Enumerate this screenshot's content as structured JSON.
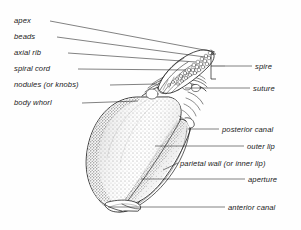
{
  "figure": {
    "background_color": "#fefefe",
    "ink_color": "#1a1a1a"
  },
  "labels_left": [
    {
      "id": "apex",
      "text": "apex",
      "x": 14,
      "y": 16,
      "line_x1": 50,
      "line_y1": 21,
      "line_x2": 215,
      "line_y2": 52
    },
    {
      "id": "beads",
      "text": "beads",
      "x": 14,
      "y": 32,
      "line_x1": 57,
      "line_y1": 37,
      "line_x2": 205,
      "line_y2": 57
    },
    {
      "id": "axial-rib",
      "text": "axial rib",
      "x": 14,
      "y": 48,
      "line_x1": 68,
      "line_y1": 53,
      "line_x2": 196,
      "line_y2": 62
    },
    {
      "id": "spiral-cord",
      "text": "spiral cord",
      "x": 14,
      "y": 64,
      "line_x1": 78,
      "line_y1": 69,
      "line_x2": 186,
      "line_y2": 70
    },
    {
      "id": "nodules",
      "text": "nodules (or knobs)",
      "x": 14,
      "y": 80,
      "line_x1": 110,
      "line_y1": 85,
      "line_x2": 157,
      "line_y2": 84
    },
    {
      "id": "body-whorl",
      "text": "body whorl",
      "x": 14,
      "y": 98,
      "line_x1": 82,
      "line_y1": 103,
      "line_x2": 138,
      "line_y2": 101
    }
  ],
  "labels_right": [
    {
      "id": "spire",
      "text": "spire",
      "x": 255,
      "y": 62,
      "line_x1": 225,
      "line_y1": 66,
      "line_x2": 252,
      "line_y2": 66
    },
    {
      "id": "suture",
      "text": "suture",
      "x": 253,
      "y": 84,
      "line_x1": 185,
      "line_y1": 88,
      "line_x2": 250,
      "line_y2": 88
    },
    {
      "id": "posterior-canal",
      "text": "posterior canal",
      "x": 222,
      "y": 125,
      "line_x1": 188,
      "line_y1": 129,
      "line_x2": 219,
      "line_y2": 129
    },
    {
      "id": "outer-lip",
      "text": "outer lip",
      "x": 247,
      "y": 142,
      "line_x1": 155,
      "line_y1": 146,
      "line_x2": 244,
      "line_y2": 146
    },
    {
      "id": "parietal-wall",
      "text": "parietal wall (or inner lip)",
      "x": 180,
      "y": 159,
      "line_x1": 163,
      "line_y1": 170,
      "line_x2": 178,
      "line_y2": 163
    },
    {
      "id": "aperture",
      "text": "aperture",
      "x": 248,
      "y": 175,
      "line_x1": 141,
      "line_y1": 179,
      "line_x2": 245,
      "line_y2": 179
    },
    {
      "id": "anterior-canal",
      "text": "anterior canal",
      "x": 228,
      "y": 203,
      "line_x1": 108,
      "line_y1": 207,
      "line_x2": 225,
      "line_y2": 207
    }
  ],
  "bracket": {
    "id": "spire-bracket",
    "x": 211,
    "y_top": 54,
    "y_bottom": 79,
    "tick_x": 225,
    "tick_y": 66
  }
}
